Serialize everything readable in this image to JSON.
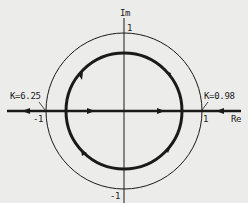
{
  "diagram": {
    "type": "root-locus",
    "axes": {
      "imag_label": "Im",
      "real_label": "Re",
      "tick_top": "1",
      "tick_bottom": "-1",
      "tick_left": "-1",
      "tick_right": "1"
    },
    "annotations": {
      "left_gain": "K=6.25",
      "right_gain": "K=0.98"
    },
    "curves": [
      {
        "name": "unit-circle",
        "radius": 1.0,
        "style": "thin"
      },
      {
        "name": "root-locus-circle",
        "radius": 0.75,
        "style": "thick",
        "direction_upper": "clockwise",
        "direction_lower": "clockwise"
      },
      {
        "name": "real-axis-locus",
        "style": "thick"
      }
    ],
    "colors": {
      "background": "#ececea",
      "ink": "#1a1a1a"
    }
  }
}
